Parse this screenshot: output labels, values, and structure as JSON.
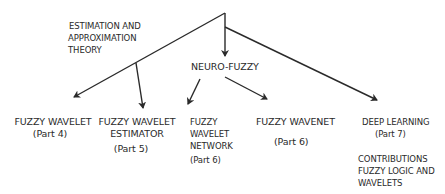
{
  "diagram": {
    "colors": {
      "line": "#2a2a2a",
      "text": "#2a2a2a",
      "background": "#ffffff"
    },
    "root_labels": {
      "estimation": [
        "ESTIMATION AND",
        "APPROXIMATION",
        "THEORY"
      ],
      "neuro_fuzzy": "NEURO-FUZZY"
    },
    "nodes": [
      {
        "id": "fuzzy-wavelet",
        "title": [
          "FUZZY WAVELET"
        ],
        "part": "(Part 4)"
      },
      {
        "id": "fuzzy-wavelet-estimator",
        "title": [
          "FUZZY WAVELET",
          "ESTIMATOR"
        ],
        "part": "(Part 5)"
      },
      {
        "id": "fuzzy-wavelet-network",
        "title": [
          "FUZZY",
          "WAVELET",
          "NETWORK"
        ],
        "part": "(Part 6)"
      },
      {
        "id": "fuzzy-wavenet",
        "title": [
          "FUZZY WAVENET"
        ],
        "part": "(Part 6)"
      },
      {
        "id": "deep-learning",
        "title": [
          "DEEP LEARNING"
        ],
        "part": "(Part 7)"
      }
    ],
    "footer_note": [
      "CONTRIBUTIONS",
      "FUZZY LOGIC AND",
      "WAVELETS"
    ],
    "edges": [
      {
        "from": "root",
        "to": "fuzzy-wavelet"
      },
      {
        "from": "root",
        "to": "neuro-fuzzy"
      },
      {
        "from": "root",
        "to": "deep-learning"
      },
      {
        "from": "estimation-branch",
        "to": "fuzzy-wavelet-estimator"
      },
      {
        "from": "neuro-fuzzy",
        "to": "fuzzy-wavelet-network"
      },
      {
        "from": "neuro-fuzzy",
        "to": "fuzzy-wavenet"
      }
    ]
  }
}
